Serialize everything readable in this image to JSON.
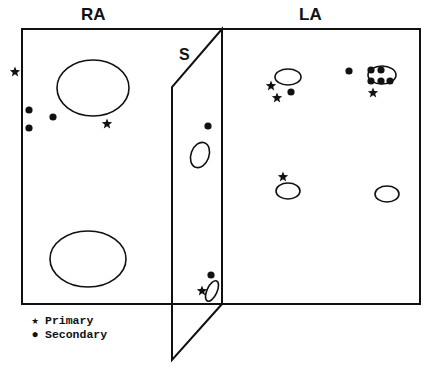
{
  "diagram": {
    "type": "atrial-map",
    "colors": {
      "stroke": "#111111",
      "background": "#ffffff"
    },
    "labels": {
      "right_atrium": "RA",
      "left_atrium": "LA",
      "septum": "S"
    },
    "legend": {
      "primary": {
        "symbol": "★",
        "label": "Primary"
      },
      "secondary": {
        "symbol": "●",
        "label": "Secondary"
      }
    },
    "regions": {
      "ra_box": {
        "x": 22,
        "y": 29,
        "w": 200,
        "h": 275
      },
      "la_box": {
        "x": 222,
        "y": 29,
        "w": 198,
        "h": 275
      },
      "septum": [
        [
          222,
          29
        ],
        [
          172,
          87
        ],
        [
          172,
          360
        ],
        [
          222,
          304
        ]
      ]
    },
    "ellipses": [
      {
        "region": "RA",
        "cx": 93,
        "cy": 88,
        "rx": 36,
        "ry": 28
      },
      {
        "region": "RA",
        "cx": 88,
        "cy": 259,
        "rx": 38,
        "ry": 28
      },
      {
        "region": "S",
        "cx": 200,
        "cy": 155,
        "rx": 9,
        "ry": 13,
        "rot": 20
      },
      {
        "region": "S",
        "cx": 212,
        "cy": 291,
        "rx": 5,
        "ry": 11,
        "rot": 25
      },
      {
        "region": "LA",
        "cx": 288,
        "cy": 77,
        "rx": 13,
        "ry": 8
      },
      {
        "region": "LA",
        "cx": 382,
        "cy": 75,
        "rx": 14,
        "ry": 9
      },
      {
        "region": "LA",
        "cx": 288,
        "cy": 191,
        "rx": 12,
        "ry": 8
      },
      {
        "region": "LA",
        "cx": 387,
        "cy": 194,
        "rx": 12,
        "ry": 8
      }
    ],
    "primary_sites": [
      {
        "x": 15,
        "y": 72
      },
      {
        "x": 107,
        "y": 124
      },
      {
        "x": 271,
        "y": 86
      },
      {
        "x": 277,
        "y": 98
      },
      {
        "x": 373,
        "y": 93
      },
      {
        "x": 283,
        "y": 177
      },
      {
        "x": 202,
        "y": 291
      }
    ],
    "secondary_sites": [
      {
        "x": 29,
        "y": 110
      },
      {
        "x": 29,
        "y": 128
      },
      {
        "x": 53,
        "y": 117
      },
      {
        "x": 208,
        "y": 126
      },
      {
        "x": 291,
        "y": 92
      },
      {
        "x": 349,
        "y": 71
      },
      {
        "x": 371,
        "y": 70
      },
      {
        "x": 381,
        "y": 70
      },
      {
        "x": 371,
        "y": 81
      },
      {
        "x": 381,
        "y": 81
      },
      {
        "x": 390,
        "y": 81
      },
      {
        "x": 211,
        "y": 275
      }
    ]
  }
}
